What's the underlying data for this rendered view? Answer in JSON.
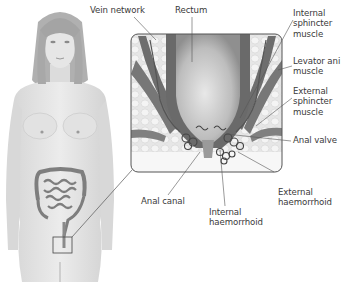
{
  "labels": {
    "vein_network": "Vein network",
    "rectum": "Rectum",
    "internal_sphincter": "Internal\nsphincter\nmuscle",
    "levator_ani": "Levator ani\nmuscle",
    "external_sphincter": "External\nsphincter\nmuscle",
    "anal_valve": "Anal valve",
    "external_haemorrhoid": "External\nhaemorrhoid",
    "anal_canal": "Anal canal",
    "internal_haemorrhoid": "Internal\nhaemorrhoid"
  },
  "colors": {
    "skin": "#e4e4e4",
    "hair": "#a8a8a8",
    "intestine": "#8a8a8a",
    "tissue_bg": "#ececec",
    "muscle": "#6e6e6e",
    "rectum": "#c8c8c8",
    "leader_line": "#555555",
    "text": "#3a3a3a"
  }
}
